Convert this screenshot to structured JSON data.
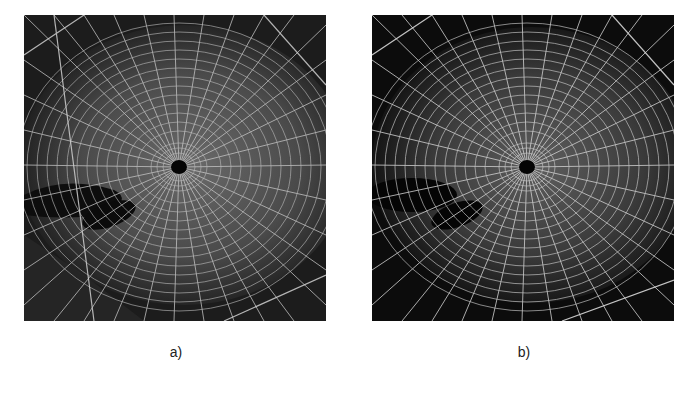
{
  "figure": {
    "panels": [
      {
        "id": "a",
        "caption": "a)",
        "subject": "spider web photograph (original, grayscale)",
        "background_color": "#141414",
        "web_color": "#bdbdbd",
        "hub_color": "#050505"
      },
      {
        "id": "b",
        "caption": "b)",
        "subject": "spider web photograph (processed, grayscale, darker background)",
        "background_color": "#0a0a0a",
        "web_color": "#c8c8c8",
        "hub_color": "#050505"
      }
    ]
  }
}
